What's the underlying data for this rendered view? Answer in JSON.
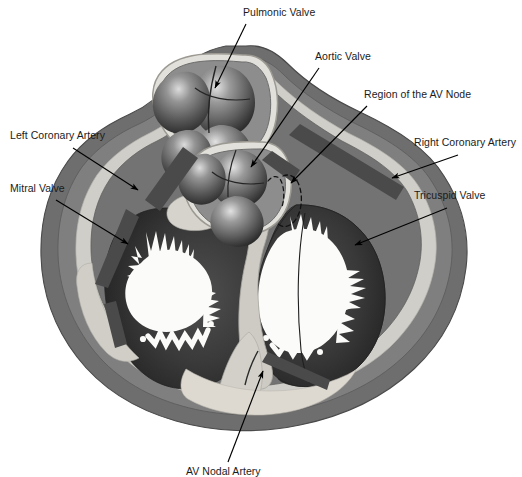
{
  "figure": {
    "type": "anatomical-diagram",
    "colors": {
      "background": "#ffffff",
      "epicardium_outer": "#6e6e6e",
      "myocardium": "#7f7f7f",
      "myocardium_dark": "#585858",
      "fibrous_skeleton": "#c9c9c4",
      "fibrous_skeleton_light": "#dedbd4",
      "endocardium_line": "#e8e6e0",
      "chamber_dark": "#3b3b3b",
      "chamber_very_dark": "#2a2a2a",
      "lumen_white": "#fbfbf9",
      "coronary_artery": "#4a4a4a",
      "valve_cusp_mid": "#6a6a6a",
      "valve_cusp_highlight": "#d8d8d8",
      "valve_cusp_shadow": "#303030",
      "leader_line": "#000000",
      "label_text": "#1b1b1b"
    }
  },
  "labels": [
    {
      "id": "pulmonic-valve",
      "text": "Pulmonic Valve",
      "x": 243,
      "y": 6,
      "align": "left",
      "leader": {
        "x1": 246,
        "y1": 24,
        "x2": 215,
        "y2": 88
      },
      "arrow_at": "end"
    },
    {
      "id": "aortic-valve",
      "text": "Aortic Valve",
      "x": 315,
      "y": 50,
      "align": "left",
      "leader": {
        "x1": 319,
        "y1": 68,
        "x2": 251,
        "y2": 167
      },
      "arrow_at": "end"
    },
    {
      "id": "region-of-the-av-node",
      "text": "Region of the AV Node",
      "x": 364,
      "y": 88,
      "align": "left",
      "leader": {
        "x1": 367,
        "y1": 106,
        "x2": 291,
        "y2": 183
      },
      "arrow_at": "end"
    },
    {
      "id": "left-coronary-artery",
      "text": "Left Coronary Artery",
      "x": 10,
      "y": 129,
      "align": "left",
      "leader": {
        "x1": 73,
        "y1": 148,
        "x2": 138,
        "y2": 190
      },
      "arrow_at": "end"
    },
    {
      "id": "right-coronary-artery",
      "text": "Right Coronary Artery",
      "x": 414,
      "y": 136,
      "align": "left",
      "leader": {
        "x1": 458,
        "y1": 155,
        "x2": 392,
        "y2": 178
      },
      "arrow_at": "end"
    },
    {
      "id": "mitral-valve",
      "text": "Mitral Valve",
      "x": 10,
      "y": 182,
      "align": "left",
      "leader": {
        "x1": 56,
        "y1": 200,
        "x2": 128,
        "y2": 244
      },
      "arrow_at": "end"
    },
    {
      "id": "tricuspid-valve",
      "text": "Tricuspid Valve",
      "x": 414,
      "y": 189,
      "align": "left",
      "leader": {
        "x1": 447,
        "y1": 208,
        "x2": 355,
        "y2": 245
      },
      "arrow_at": "end"
    },
    {
      "id": "av-nodal-artery",
      "text": "AV Nodal Artery",
      "x": 186,
      "y": 465,
      "align": "left",
      "leader": {
        "x1": 228,
        "y1": 462,
        "x2": 263,
        "y2": 371
      },
      "arrow_at": "end"
    }
  ],
  "structures": [
    {
      "id": "pulmonic-valve-cusps",
      "name": "Pulmonic Valve",
      "cusps": 3
    },
    {
      "id": "aortic-valve-cusps",
      "name": "Aortic Valve",
      "cusps": 3
    },
    {
      "id": "mitral-valve-orifice",
      "name": "Mitral Valve",
      "leaflets": 2
    },
    {
      "id": "tricuspid-valve-orifice",
      "name": "Tricuspid Valve",
      "leaflets": 3
    },
    {
      "id": "left-coronary-artery-band",
      "name": "Left Coronary Artery"
    },
    {
      "id": "right-coronary-artery-band",
      "name": "Right Coronary Artery"
    },
    {
      "id": "av-node-region-dashed",
      "name": "Region of the AV Node"
    },
    {
      "id": "av-nodal-artery-band",
      "name": "AV Nodal Artery"
    },
    {
      "id": "fibrous-skeleton",
      "name": "Fibrous Skeleton"
    },
    {
      "id": "myocardium",
      "name": "Myocardium"
    },
    {
      "id": "epicardium",
      "name": "Epicardium"
    }
  ]
}
